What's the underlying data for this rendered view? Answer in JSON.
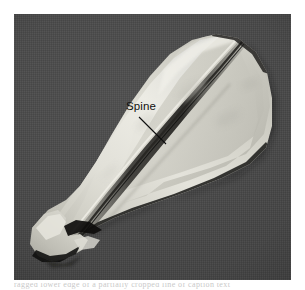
{
  "figure": {
    "kind": "anatomical-photograph",
    "view": "lateral",
    "background_color": "#484848",
    "specimen_color": "#dcdcd6",
    "annotations": [
      {
        "id": "spine",
        "label": "Spine",
        "label_color": "#111111",
        "leader_line": true
      }
    ]
  },
  "caption": {
    "sliver_text": "ragged lower edge of a partially cropped line of caption text"
  }
}
